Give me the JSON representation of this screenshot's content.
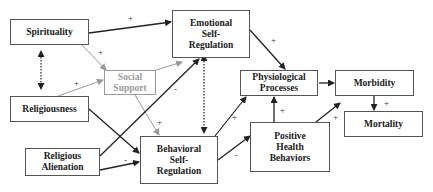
{
  "diagram": {
    "nodes": {
      "spirituality": "Spirituality",
      "religiousness": "Religiousness",
      "religious_alienation": "Religious Alienation",
      "social_support": "Social Support",
      "emotional_self_regulation": "Emotional Self-Regulation",
      "behavioral_self_regulation": "Behavioral Self-Regulation",
      "physiological_processes": "Physiological Processes",
      "positive_health_behaviors": "Positive Health Behaviors",
      "morbidity": "Morbidity",
      "mortality": "Mortality"
    },
    "node_lines": {
      "religious_alienation": [
        "Religious",
        "Alienation"
      ],
      "social_support": [
        "Social",
        "Support"
      ],
      "emotional_self_regulation": [
        "Emotional",
        "Self-",
        "Regulation"
      ],
      "behavioral_self_regulation": [
        "Behavioral",
        "Self-",
        "Regulation"
      ],
      "physiological_processes": [
        "Physiological",
        "Processes"
      ],
      "positive_health_behaviors": [
        "Positive",
        "Health",
        "Behaviors"
      ]
    },
    "edges": [
      {
        "from": "Spirituality",
        "to": "Emotional Self-Regulation",
        "sign": "+"
      },
      {
        "from": "Spirituality",
        "to": "Social Support",
        "sign": "+"
      },
      {
        "from": "Spirituality",
        "to": "Religiousness",
        "sign": "",
        "style": "dotted-bidirectional"
      },
      {
        "from": "Religiousness",
        "to": "Social Support",
        "sign": "+"
      },
      {
        "from": "Religiousness",
        "to": "Behavioral Self-Regulation",
        "sign": ""
      },
      {
        "from": "Social Support",
        "to": "Emotional Self-Regulation",
        "sign": ""
      },
      {
        "from": "Social Support",
        "to": "Behavioral Self-Regulation",
        "sign": "+"
      },
      {
        "from": "Religious Alienation",
        "to": "Emotional Self-Regulation",
        "sign": "-"
      },
      {
        "from": "Religious Alienation",
        "to": "Behavioral Self-Regulation",
        "sign": "-"
      },
      {
        "from": "Emotional Self-Regulation",
        "to": "Behavioral Self-Regulation",
        "sign": "",
        "style": "dotted-bidirectional"
      },
      {
        "from": "Emotional Self-Regulation",
        "to": "Physiological Processes",
        "sign": "+"
      },
      {
        "from": "Behavioral Self-Regulation",
        "to": "Physiological Processes",
        "sign": "+"
      },
      {
        "from": "Behavioral Self-Regulation",
        "to": "Positive Health Behaviors",
        "sign": "-"
      },
      {
        "from": "Positive Health Behaviors",
        "to": "Physiological Processes",
        "sign": "+"
      },
      {
        "from": "Positive Health Behaviors",
        "to": "Morbidity",
        "sign": "+"
      },
      {
        "from": "Physiological Processes",
        "to": "Morbidity",
        "sign": ""
      },
      {
        "from": "Morbidity",
        "to": "Mortality",
        "sign": "+"
      }
    ],
    "labels": {
      "plus": "+",
      "minus": "-"
    }
  }
}
